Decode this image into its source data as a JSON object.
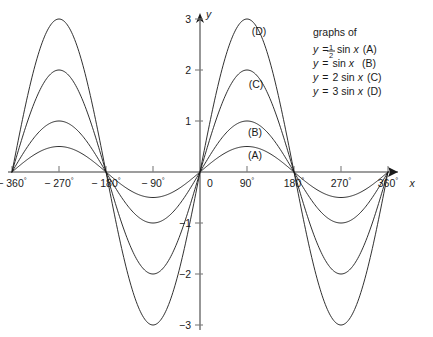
{
  "chart_data": {
    "type": "line",
    "title": "",
    "xlabel": "x",
    "ylabel": "y",
    "xlim": [
      -390,
      375
    ],
    "ylim": [
      -3.35,
      3.35
    ],
    "grid": false,
    "legend_position": "top-right",
    "x_tick_labels": [
      "− 360°",
      "− 270°",
      "− 180°",
      "− 90°",
      "0",
      "90°",
      "180°",
      "270°",
      "360°"
    ],
    "x_tick_values": [
      -360,
      -270,
      -180,
      -90,
      0,
      90,
      180,
      270,
      360
    ],
    "y_tick_labels": [
      "3",
      "2",
      "1",
      "−1",
      "−2",
      "−3"
    ],
    "y_tick_values": [
      3,
      2,
      1,
      -1,
      -2,
      -3
    ],
    "series": [
      {
        "name": "A",
        "label": "(A)",
        "equation": "y = ½ sin x",
        "amplitude": 0.5,
        "peak_value": 0.5,
        "trough_value": -0.5
      },
      {
        "name": "B",
        "label": "(B)",
        "equation": "y = sin x",
        "amplitude": 1,
        "peak_value": 1,
        "trough_value": -1
      },
      {
        "name": "C",
        "label": "(C)",
        "equation": "y = 2 sin x",
        "amplitude": 2,
        "peak_value": 2,
        "trough_value": -2
      },
      {
        "name": "D",
        "label": "(D)",
        "equation": "y = 3 sin x",
        "amplitude": 3,
        "peak_value": 3,
        "trough_value": -3
      }
    ]
  },
  "axes": {
    "x_label": "x",
    "y_label": "y",
    "x_ticks": [
      {
        "value": -360,
        "label_prefix": "− 360",
        "label_suffix": "°"
      },
      {
        "value": -270,
        "label_prefix": "− 270",
        "label_suffix": "°"
      },
      {
        "value": -180,
        "label_prefix": "− 180",
        "label_suffix": "°"
      },
      {
        "value": -90,
        "label_prefix": "− 90",
        "label_suffix": "°"
      },
      {
        "value": 0,
        "label_prefix": "0",
        "label_suffix": ""
      },
      {
        "value": 90,
        "label_prefix": "90",
        "label_suffix": "°"
      },
      {
        "value": 180,
        "label_prefix": "180",
        "label_suffix": "°"
      },
      {
        "value": 270,
        "label_prefix": "270",
        "label_suffix": "°"
      },
      {
        "value": 360,
        "label_prefix": "360",
        "label_suffix": "°"
      }
    ],
    "y_ticks": [
      {
        "value": 3,
        "label": "3"
      },
      {
        "value": 2,
        "label": "2"
      },
      {
        "value": 1,
        "label": "1"
      },
      {
        "value": -1,
        "label": "−1"
      },
      {
        "value": -2,
        "label": "−2"
      },
      {
        "value": -3,
        "label": "−3"
      }
    ]
  },
  "curve_labels": {
    "a": "(A)",
    "b": "(B)",
    "c": "(C)",
    "d": "(D)"
  },
  "legend": {
    "title": "graphs of",
    "entries": [
      {
        "y_var": "y",
        "equals": "=",
        "coefficient_numerator": "1",
        "coefficient_denominator": "2",
        "func": "sin",
        "var": "x",
        "tag": "(A)"
      },
      {
        "y_var": "y",
        "equals": "=",
        "coefficient": "",
        "func": "sin",
        "var": "x",
        "tag": "(B)"
      },
      {
        "y_var": "y",
        "equals": "=",
        "coefficient": "2",
        "func": "sin",
        "var": "x",
        "tag": "(C)"
      },
      {
        "y_var": "y",
        "equals": "=",
        "coefficient": "3",
        "func": "sin",
        "var": "x",
        "tag": "(D)"
      }
    ]
  },
  "colors": {
    "background": "#ffffff",
    "curve": "#1a1a1a",
    "axis": "#7d7d7d",
    "text": "#1a1a1a"
  }
}
